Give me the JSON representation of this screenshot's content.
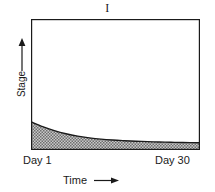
{
  "chart_data": {
    "type": "area",
    "title": "I",
    "xlabel": "Time",
    "ylabel": "Stage",
    "xtick_labels": [
      "Day 1",
      "Day 30"
    ],
    "ytick_labels": [],
    "grid": false,
    "legend": null,
    "xlim": [
      1,
      30
    ],
    "ylim": [
      0,
      1
    ],
    "axis_arrows": {
      "y": "up",
      "x": "right"
    },
    "fill_style": "stipple-hatch",
    "fill_color": "#9a9a9a",
    "line_color": "#1a1a1a",
    "frame_color": "#1a1a1a",
    "background_color": "#ffffff",
    "series": [
      {
        "name": "Stage",
        "x": [
          1,
          3,
          5,
          7,
          9,
          11,
          13,
          15,
          17,
          19,
          21,
          23,
          25,
          27,
          30
        ],
        "values": [
          0.215,
          0.178,
          0.148,
          0.124,
          0.106,
          0.093,
          0.083,
          0.076,
          0.071,
          0.067,
          0.064,
          0.061,
          0.059,
          0.057,
          0.055
        ]
      }
    ]
  },
  "figure": {
    "title": "I",
    "y_axis": {
      "label": "Stage",
      "arrow": "↑"
    },
    "x_axis": {
      "label": "Time",
      "arrow": "→",
      "tick_start": "Day 1",
      "tick_end": "Day 30"
    }
  }
}
